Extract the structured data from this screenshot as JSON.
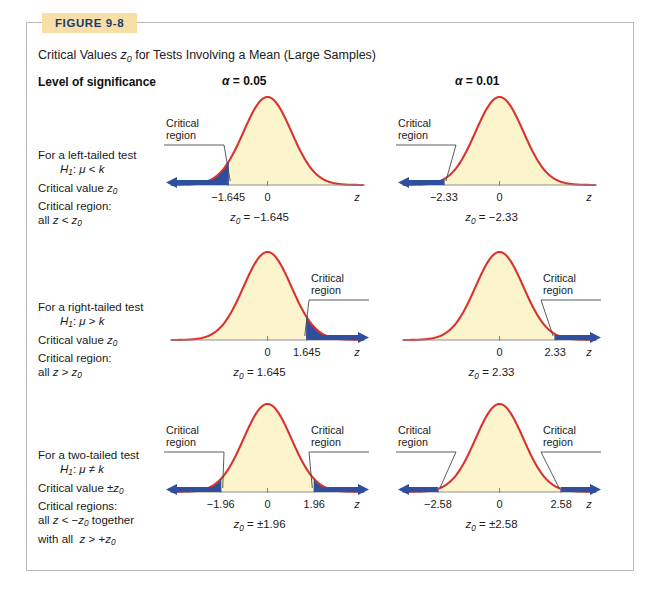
{
  "figure": {
    "tag": "FIGURE 9-8",
    "level_label": "Level of significance",
    "alpha_headers": [
      "α = 0.05",
      "α = 0.01"
    ],
    "callout_label_line1": "Critical",
    "callout_label_line2": "region",
    "axis_letter": "z",
    "accent_curve_color": "#d8332e",
    "curve_fill_color": "#fbf4cd",
    "critical_region_color": "#2f4f9e",
    "tag_background_color": "#f8dfa8",
    "tag_text_color": "#1b3a6b",
    "frame_border_color": "#b9b9b9"
  },
  "rows": [
    {
      "desc_lines": [
        "For a left-tailed test",
        "H₁: μ < k",
        "Critical value z₀",
        "Critical region:",
        "all z < z₀"
      ],
      "tail": "left"
    },
    {
      "desc_lines": [
        "For a right-tailed test",
        "H₁: μ > k",
        "Critical value z₀",
        "Critical region:",
        "all z > z₀"
      ],
      "tail": "right"
    },
    {
      "desc_lines": [
        "For a two-tailed test",
        "H₁: μ ≠ k",
        "Critical value ±z₀",
        "Critical regions:",
        "all z < −z₀ together",
        "with all  z > +z₀"
      ],
      "tail": "two"
    }
  ],
  "chart_data": {
    "type": "line",
    "xlabel": "z",
    "ylabel": "",
    "grid": false,
    "curve": "standard normal density",
    "xlim": [
      -4,
      4
    ],
    "panels": [
      {
        "row": 0,
        "col": 0,
        "alpha": 0.05,
        "tail": "left",
        "tick_labels": [
          "−1.645",
          "0"
        ],
        "tick_values": [
          -1.645,
          0
        ],
        "critical_values": [
          -1.645
        ],
        "shaded_interval": [
          -4,
          -1.645
        ],
        "z0_text": "z₀ = −1.645",
        "callout": "Critical region"
      },
      {
        "row": 0,
        "col": 1,
        "alpha": 0.01,
        "tail": "left",
        "tick_labels": [
          "−2.33",
          "0"
        ],
        "tick_values": [
          -2.33,
          0
        ],
        "critical_values": [
          -2.33
        ],
        "shaded_interval": [
          -4,
          -2.33
        ],
        "z0_text": "z₀ = −2.33",
        "callout": "Critical region"
      },
      {
        "row": 1,
        "col": 0,
        "alpha": 0.05,
        "tail": "right",
        "tick_labels": [
          "0",
          "1.645"
        ],
        "tick_values": [
          0,
          1.645
        ],
        "critical_values": [
          1.645
        ],
        "shaded_interval": [
          1.645,
          4
        ],
        "z0_text": "z₀ = 1.645",
        "callout": "Critical region"
      },
      {
        "row": 1,
        "col": 1,
        "alpha": 0.01,
        "tail": "right",
        "tick_labels": [
          "0",
          "2.33"
        ],
        "tick_values": [
          0,
          2.33
        ],
        "critical_values": [
          2.33
        ],
        "shaded_interval": [
          2.33,
          4
        ],
        "z0_text": "z₀ = 2.33",
        "callout": "Critical region"
      },
      {
        "row": 2,
        "col": 0,
        "alpha": 0.05,
        "tail": "two",
        "tick_labels": [
          "−1.96",
          "0",
          "1.96"
        ],
        "tick_values": [
          -1.96,
          0,
          1.96
        ],
        "critical_values": [
          -1.96,
          1.96
        ],
        "shaded_interval": [
          [
            -4,
            -1.96
          ],
          [
            1.96,
            4
          ]
        ],
        "z0_text": "z₀ = ±1.96",
        "callout": "Critical region"
      },
      {
        "row": 2,
        "col": 1,
        "alpha": 0.01,
        "tail": "two",
        "tick_labels": [
          "−2.58",
          "0",
          "2.58"
        ],
        "tick_values": [
          -2.58,
          0,
          2.58
        ],
        "critical_values": [
          -2.58,
          2.58
        ],
        "shaded_interval": [
          [
            -4,
            -2.58
          ],
          [
            2.58,
            4
          ]
        ],
        "z0_text": "z₀ = ±2.58",
        "callout": "Critical region"
      }
    ]
  }
}
